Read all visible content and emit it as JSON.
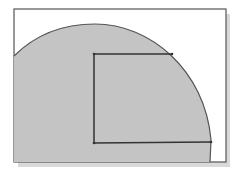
{
  "diagram": {
    "frame": {
      "x": 14,
      "y": 9,
      "w": 212,
      "h": 153,
      "stroke": "#555555",
      "fill": "#ffffff",
      "shadow": "#d8d8d8"
    },
    "region": {
      "fill": "#c4c4c4",
      "stroke": "#555555"
    },
    "rectangle": {
      "x1": 94,
      "y1": 54,
      "x2": 211,
      "y2": 143,
      "stroke": "#333333"
    }
  }
}
